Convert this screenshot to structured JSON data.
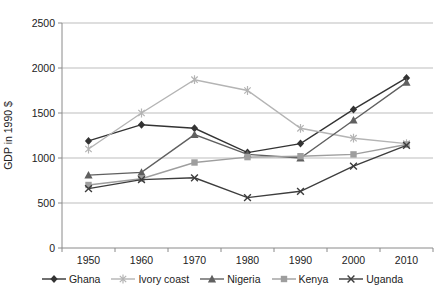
{
  "chart_data": {
    "type": "line",
    "title": "",
    "xlabel": "",
    "ylabel": "GDP in 1990 $",
    "x": [
      "1950",
      "1960",
      "1970",
      "1980",
      "1990",
      "2000",
      "2010"
    ],
    "ylim": [
      0,
      2500
    ],
    "ytick_step": 500,
    "ytick_labels": [
      "0",
      "500",
      "1000",
      "1500",
      "2000",
      "2500"
    ],
    "grid": true,
    "legend_position": "bottom",
    "series": [
      {
        "name": "Ghana",
        "marker": "diamond",
        "color": "#333333",
        "values": [
          1190,
          1370,
          1330,
          1060,
          1160,
          1540,
          1890
        ]
      },
      {
        "name": "Ivory coast",
        "marker": "asterisk",
        "color": "#b4b4b4",
        "values": [
          1100,
          1500,
          1870,
          1750,
          1330,
          1220,
          1160
        ]
      },
      {
        "name": "Nigeria",
        "marker": "triangle",
        "color": "#606060",
        "values": [
          810,
          840,
          1260,
          1040,
          1000,
          1420,
          1840
        ]
      },
      {
        "name": "Kenya",
        "marker": "square",
        "color": "#9e9e9e",
        "values": [
          700,
          770,
          950,
          1010,
          1020,
          1040,
          1150
        ]
      },
      {
        "name": "Uganda",
        "marker": "x",
        "color": "#3d3d3d",
        "values": [
          660,
          760,
          780,
          560,
          630,
          910,
          1140
        ]
      }
    ]
  },
  "style": {
    "grid_color": "#bdbdbd",
    "axis_color": "#8a8a8a",
    "text_color": "#222222",
    "background": "#ffffff"
  }
}
